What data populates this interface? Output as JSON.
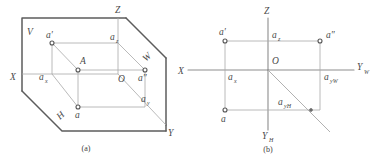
{
  "figure": {
    "title_a": "(a)",
    "title_b": "(b)",
    "line_color": "#5c5c5c",
    "thin_color": "#a8a8a8",
    "axis_color": "#8d8d8d",
    "text_color": "#4a4a4a",
    "background": "#ffffff"
  },
  "diagram_a": {
    "caption": "(a)",
    "planes": {
      "v": "V",
      "h": "H",
      "w": "W"
    },
    "axes": {
      "x": "X",
      "y": "Y",
      "z": "Z"
    },
    "origin": "O",
    "point_space": "A",
    "proj_front": "a′",
    "proj_top": "a",
    "proj_side": "a″",
    "ax_base": "a",
    "ax_sub": "x",
    "ay_base": "a",
    "ay_sub": "y",
    "az_base": "a",
    "az_sub": "z"
  },
  "diagram_b": {
    "caption": "(b)",
    "axes": {
      "x": "X",
      "z": "Z",
      "yw_base": "Y",
      "yw_sub": "W",
      "yh_base": "Y",
      "yh_sub": "H"
    },
    "origin": "O",
    "proj_front": "a′",
    "proj_top": "a",
    "proj_side": "a″",
    "ax_base": "a",
    "ax_sub": "x",
    "az_base": "a",
    "az_sub": "z",
    "ayw_base": "a",
    "ayw_sub": "yW",
    "ayh_base": "a",
    "ayh_sub": "yH"
  }
}
